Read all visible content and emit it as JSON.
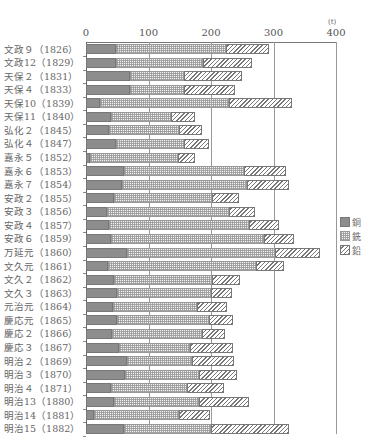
{
  "chart_data": {
    "type": "bar",
    "orientation": "horizontal",
    "stacked": true,
    "title": "",
    "xlabel": "",
    "ylabel": "",
    "unit": "(t)",
    "xlim": [
      0,
      400
    ],
    "x_ticks": [
      0,
      100,
      200,
      300,
      400
    ],
    "grid": true,
    "legend_position": "right",
    "categories": [
      "文政９（1826）",
      "文政12（1829）",
      "天保２（1831）",
      "天保４（1833）",
      "天保10（1839）",
      "天保11（1840）",
      "弘化２（1845）",
      "弘化４（1847）",
      "嘉永５（1852）",
      "嘉永６（1853）",
      "嘉永７（1854）",
      "安政２（1855）",
      "安政３（1856）",
      "安政４（1857）",
      "安政６（1859）",
      "万延元（1860）",
      "文久元（1861）",
      "文久２（1862）",
      "文久３（1863）",
      "元治元（1864）",
      "慶応元（1865）",
      "慶応２（1866）",
      "慶応３（1867）",
      "明治２（1869）",
      "明治３（1870）",
      "明治４（1871）",
      "明治13（1880）",
      "明治14（1881）",
      "明治15（1882）"
    ],
    "series": [
      {
        "name": "銅",
        "pattern": "solid",
        "color": "#8d8d8d",
        "values": [
          48,
          48,
          70,
          70,
          22,
          40,
          37,
          48,
          6,
          60,
          57,
          44,
          34,
          37,
          40,
          66,
          35,
          45,
          49,
          43,
          50,
          41,
          52,
          65,
          62,
          40,
          45,
          13,
          60
        ]
      },
      {
        "name": "銑",
        "pattern": "grid",
        "color": "#bdbdbd",
        "values": [
          176,
          139,
          86,
          87,
          206,
          96,
          112,
          109,
          141,
          193,
          201,
          157,
          194,
          223,
          244,
          237,
          237,
          157,
          151,
          134,
          146,
          144,
          115,
          104,
          119,
          122,
          136,
          135,
          140
        ]
      },
      {
        "name": "鉛",
        "pattern": "hatch",
        "color": "#777777",
        "values": [
          68,
          78,
          94,
          82,
          102,
          39,
          36,
          40,
          27,
          67,
          67,
          44,
          43,
          48,
          49,
          72,
          45,
          44,
          33,
          49,
          39,
          38,
          68,
          68,
          60,
          58,
          80,
          51,
          124
        ]
      }
    ]
  },
  "axis": {
    "unit_label": "(t)",
    "ticks": [
      "0",
      "100",
      "200",
      "300",
      "400"
    ]
  },
  "legend": [
    {
      "label": "銅",
      "key": "copper"
    },
    {
      "label": "銑",
      "key": "iron"
    },
    {
      "label": "鉛",
      "key": "lead"
    }
  ]
}
